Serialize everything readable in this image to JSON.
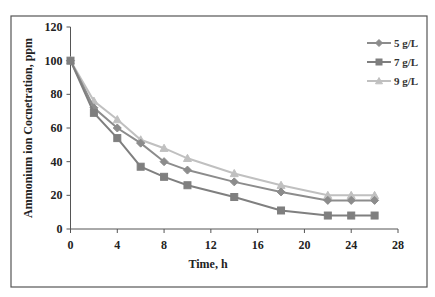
{
  "chart_data": {
    "type": "line",
    "title": "",
    "xlabel": "Time, h",
    "ylabel": "Ammonium ion Cocnetration, ppm",
    "xlim": [
      0,
      28
    ],
    "ylim": [
      0,
      120
    ],
    "xticks": [
      0,
      4,
      8,
      12,
      16,
      20,
      24,
      28
    ],
    "yticks": [
      0,
      20,
      40,
      60,
      80,
      100,
      120
    ],
    "grid": false,
    "legend_position": "top-right",
    "x": [
      0,
      2,
      4,
      6,
      8,
      10,
      14,
      18,
      22,
      24,
      26
    ],
    "series": [
      {
        "name": "5 g/L",
        "marker": "diamond",
        "color": "#8c8c8c",
        "values": [
          100,
          72,
          60,
          51,
          40,
          35,
          28,
          22,
          17,
          17,
          17
        ]
      },
      {
        "name": "7 g/L",
        "marker": "square",
        "color": "#7f7f7f",
        "values": [
          100,
          69,
          54,
          37,
          31,
          26,
          19,
          11,
          8,
          8,
          8
        ]
      },
      {
        "name": "9 g/L",
        "marker": "triangle",
        "color": "#c0c0c0",
        "values": [
          100,
          76,
          65,
          53,
          48,
          42,
          33,
          26,
          20,
          20,
          20
        ]
      }
    ]
  }
}
